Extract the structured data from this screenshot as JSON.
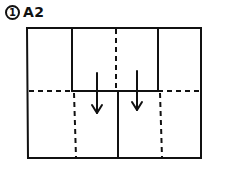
{
  "step": {
    "number": "1",
    "title": "A2"
  },
  "diagram": {
    "stroke_color": "#111111",
    "background": "#ffffff",
    "arrows": [
      {
        "direction": "down"
      },
      {
        "direction": "down"
      }
    ]
  }
}
